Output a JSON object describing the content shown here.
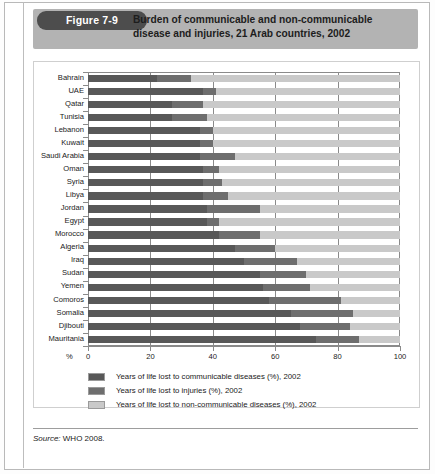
{
  "figure": {
    "badge": "Figure 7-9",
    "title_line1": "Burden of communicable and non-communicable",
    "title_line2": "disease and injuries, 21 Arab countries, 2002"
  },
  "source": {
    "prefix": "Source:",
    "text": " WHO 2008."
  },
  "colors": {
    "communicable": "#585858",
    "injuries": "#6e6e6e",
    "non_communicable": "#c9c9c9",
    "band": "#b3b3b3",
    "badge": "#4d4d4d"
  },
  "legend": {
    "items": [
      {
        "label": "Years of life lost to communicable diseases (%), 2002",
        "color": "#585858",
        "key": "communicable"
      },
      {
        "label": "Years of life lost to injuries (%), 2002",
        "color": "#6e6e6e",
        "key": "injuries"
      },
      {
        "label": "Years of life lost to non-communicable diseases (%), 2002",
        "color": "#c9c9c9",
        "key": "non_communicable"
      }
    ]
  },
  "chart_data": {
    "type": "bar",
    "orientation": "horizontal",
    "stacked": true,
    "title": "Burden of communicable and non-communicable disease and injuries, 21 Arab countries, 2002",
    "xlabel": "%",
    "ylabel": "",
    "xlim": [
      0,
      100
    ],
    "xticks": [
      0,
      20,
      40,
      60,
      80,
      100
    ],
    "grid": "vertical",
    "legend_position": "below",
    "categories": [
      "Bahrain",
      "UAE",
      "Qatar",
      "Tunisia",
      "Lebanon",
      "Kuwait",
      "Saudi Arabia",
      "Oman",
      "Syria",
      "Libya",
      "Jordan",
      "Egypt",
      "Morocco",
      "Algeria",
      "Iraq",
      "Sudan",
      "Yemen",
      "Comoros",
      "Somalia",
      "Djibouti",
      "Mauritania"
    ],
    "series": [
      {
        "name": "Years of life lost to communicable diseases (%), 2002",
        "key": "communicable",
        "color": "#585858",
        "values": [
          22,
          37,
          27,
          27,
          36,
          36,
          36,
          37,
          37,
          37,
          38,
          38,
          42,
          47,
          50,
          55,
          56,
          58,
          65,
          68,
          73
        ]
      },
      {
        "name": "Years of life lost to injuries (%), 2002",
        "key": "injuries",
        "color": "#6e6e6e",
        "values": [
          11,
          4,
          10,
          11,
          4,
          4,
          11,
          5,
          6,
          8,
          17,
          4,
          13,
          13,
          17,
          15,
          15,
          23,
          20,
          16,
          14
        ]
      },
      {
        "name": "Years of life lost to non-communicable diseases (%), 2002",
        "key": "non_communicable",
        "color": "#c9c9c9",
        "values": [
          67,
          59,
          63,
          62,
          60,
          60,
          53,
          58,
          57,
          55,
          45,
          58,
          45,
          40,
          33,
          30,
          29,
          19,
          15,
          16,
          13
        ]
      }
    ]
  }
}
